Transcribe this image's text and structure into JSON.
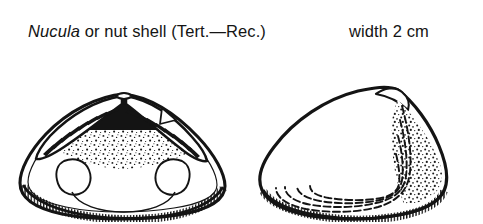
{
  "figure": {
    "caption": {
      "genus": "Nucula",
      "rest": " or nut shell (Tert.—Rec.)",
      "full_text": "Nucula or nut shell (Tert.—Rec.)",
      "scale_note": "width 2 cm"
    },
    "background_color": "#ffffff",
    "ink_color": "#141414",
    "views": [
      {
        "id": "interior-view",
        "label": "interior of left valve",
        "position": "left",
        "features": [
          {
            "name": "taxodont-hinge-teeth-anterior",
            "description": "comb-like row of chevron teeth along anterior dorsal margin"
          },
          {
            "name": "taxodont-hinge-teeth-posterior",
            "description": "comb-like row of chevron teeth along posterior dorsal margin"
          },
          {
            "name": "ligament-pit",
            "description": "dark triangular chondrophore beneath the beak"
          },
          {
            "name": "anterior-adductor-scar",
            "description": "oval muscle scar, anterior"
          },
          {
            "name": "posterior-adductor-scar",
            "description": "oval muscle scar, posterior"
          },
          {
            "name": "pallial-line",
            "description": "thin arc connecting the two muscle scars"
          },
          {
            "name": "crenulate-ventral-margin",
            "description": "finely toothed ventral shell edge"
          },
          {
            "name": "stippled-shading",
            "description": "stipple texture below the hinge"
          }
        ]
      },
      {
        "id": "exterior-view",
        "label": "exterior of right valve",
        "position": "right",
        "features": [
          {
            "name": "umbo",
            "description": "rounded beak at upper posterior"
          },
          {
            "name": "concentric-growth-lines",
            "description": "four broken concentric growth lines"
          },
          {
            "name": "posterior-stippling",
            "description": "dense stipple shading on posterior slope"
          },
          {
            "name": "crenulate-ventral-margin",
            "description": "finely toothed ventral shell edge"
          }
        ]
      }
    ]
  }
}
